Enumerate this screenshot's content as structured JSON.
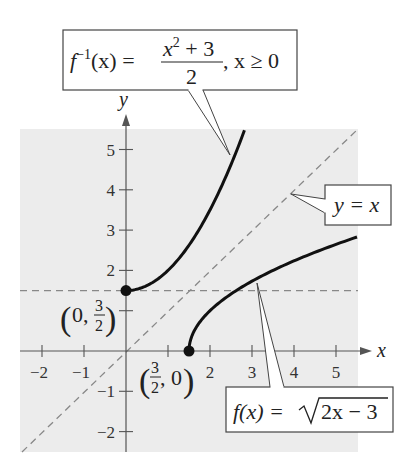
{
  "chart_data": {
    "type": "line",
    "title": "",
    "xlabel": "x",
    "ylabel": "y",
    "xlim": [
      -2.5,
      5.5
    ],
    "ylim": [
      -2.5,
      5.5
    ],
    "grid": false,
    "background": "#ececec",
    "x_ticks": [
      -2,
      -1,
      1,
      2,
      3,
      4,
      5
    ],
    "x_tick_labels": [
      "−2",
      "−1",
      "",
      "2",
      "3",
      "4",
      "5"
    ],
    "y_ticks": [
      -2,
      -1,
      1,
      2,
      3,
      4,
      5
    ],
    "y_tick_labels": [
      "−2",
      "−1",
      "",
      "2",
      "3",
      "4",
      "5"
    ],
    "series": [
      {
        "name": "f^{-1}(x) = (x^2 + 3)/2, x ≥ 0",
        "style": "solid",
        "color": "#111111",
        "domain": [
          0,
          2.82
        ],
        "x": [
          0,
          0.5,
          1,
          1.5,
          2,
          2.5,
          2.82
        ],
        "y": [
          1.5,
          1.625,
          2,
          2.625,
          3.5,
          4.625,
          5.48
        ]
      },
      {
        "name": "f(x) = √(2x − 3)",
        "style": "solid",
        "color": "#111111",
        "domain": [
          1.5,
          5.5
        ],
        "x": [
          1.5,
          2,
          2.5,
          3,
          3.5,
          4,
          4.5,
          5,
          5.5
        ],
        "y": [
          0,
          1,
          1.414,
          1.732,
          2,
          2.236,
          2.449,
          2.646,
          2.828
        ]
      },
      {
        "name": "y = x",
        "style": "dashed",
        "color": "#888888",
        "domain": [
          -2.5,
          5.5
        ],
        "x": [
          -2.5,
          5.5
        ],
        "y": [
          -2.5,
          5.5
        ]
      },
      {
        "name": "y = 3/2",
        "style": "dashed",
        "color": "#888888",
        "domain": [
          -2.5,
          5.5
        ],
        "x": [
          -2.5,
          5.5
        ],
        "y": [
          1.5,
          1.5
        ]
      }
    ],
    "points": [
      {
        "x": 0,
        "y": 1.5,
        "label": "(0, 3/2)"
      },
      {
        "x": 1.5,
        "y": 0,
        "label": "(3/2, 0)"
      }
    ],
    "annotations": [
      {
        "text": "f⁻¹(x) = (x² + 3)/2, x ≥ 0",
        "points_to": [
          2.47,
          4.88
        ]
      },
      {
        "text": "y = x",
        "points_to": [
          3.9,
          3.9
        ]
      },
      {
        "text": "f(x) = √(2x − 3)",
        "points_to": [
          3.14,
          1.69
        ]
      }
    ]
  },
  "labels": {
    "axis_x": "x",
    "axis_y": "y",
    "finv_lhs": "f",
    "finv_sup": "−1",
    "finv_arg": "(x) =",
    "finv_num": "x",
    "finv_num_sup": "2",
    "finv_num_rest": " + 3",
    "finv_den": "2",
    "finv_cond": ", x ≥ 0",
    "yx": "y = x",
    "f_lhs": "f(x) =",
    "f_rad": "2x − 3",
    "pt1_a": "0,",
    "pt1_num": "3",
    "pt1_den": "2",
    "pt2_num": "3",
    "pt2_den": "2",
    "pt2_b": ", 0"
  }
}
